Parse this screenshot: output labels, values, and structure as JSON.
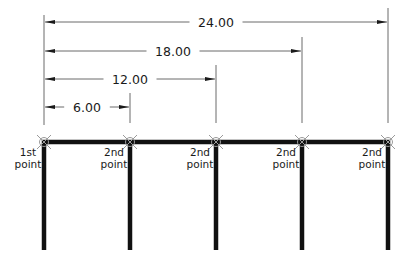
{
  "diagram": {
    "type": "dimensioned-fence-layout",
    "origin_x": 44,
    "beam_y": 142,
    "post_bottom_y": 250,
    "post_spacing_px": 86,
    "colors": {
      "structure": "#111111",
      "dimension_lines": "#6b6b6b",
      "text": "#1a1a1a",
      "snap_marker": "#9a9a9a"
    },
    "dimensions": [
      {
        "label": "24.00",
        "y": 22,
        "end_x": 388
      },
      {
        "label": "18.00",
        "y": 51,
        "end_x": 302
      },
      {
        "label": "12.00",
        "y": 79,
        "end_x": 216
      },
      {
        "label": "6.00",
        "y": 107,
        "end_x": 130
      }
    ],
    "points": [
      {
        "x": 44,
        "line1": "1st",
        "line2": "point"
      },
      {
        "x": 130,
        "line1": "2nd",
        "line2": "point"
      },
      {
        "x": 216,
        "line1": "2nd",
        "line2": "point"
      },
      {
        "x": 302,
        "line1": "2nd",
        "line2": "point"
      },
      {
        "x": 388,
        "line1": "2nd",
        "line2": "point"
      }
    ]
  }
}
